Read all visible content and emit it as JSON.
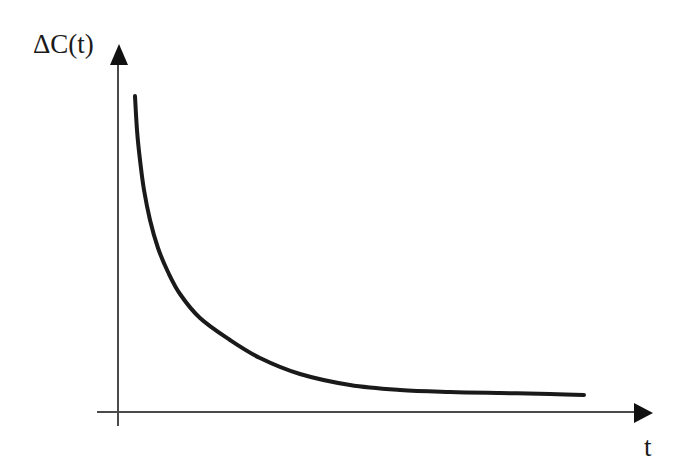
{
  "diagram": {
    "title": "",
    "y_axis_label": "ΔC(t)",
    "x_axis_label": "t",
    "colors": {
      "background": "#ffffff",
      "axis": "#4a4a4a",
      "curve": "#1a1a1a",
      "text": "#1a1a1a"
    }
  },
  "chart_data": {
    "type": "line",
    "title": "",
    "xlabel": "t",
    "ylabel": "ΔC(t)",
    "grid": false,
    "legend": null,
    "series": [
      {
        "name": "ΔC(t)",
        "pixel_points": [
          [
            135,
            96
          ],
          [
            137,
            130
          ],
          [
            140,
            160
          ],
          [
            144,
            190
          ],
          [
            150,
            220
          ],
          [
            158,
            248
          ],
          [
            168,
            272
          ],
          [
            180,
            294
          ],
          [
            200,
            318
          ],
          [
            230,
            340
          ],
          [
            260,
            358
          ],
          [
            300,
            374
          ],
          [
            350,
            385
          ],
          [
            400,
            390
          ],
          [
            450,
            392
          ],
          [
            500,
            393
          ],
          [
            550,
            394
          ],
          [
            584,
            395
          ]
        ]
      }
    ]
  }
}
